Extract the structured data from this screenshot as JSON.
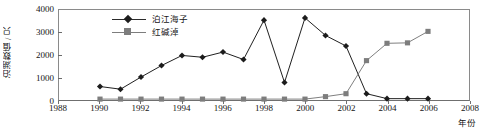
{
  "chart_data": {
    "type": "line",
    "title": "",
    "xlabel": "年份",
    "ylabel": "泊湖数值 / 只",
    "xlim": [
      1988,
      2008
    ],
    "ylim": [
      0,
      4000
    ],
    "ytick_labels": [
      "0",
      "1000",
      "2000",
      "3000",
      "4000"
    ],
    "ytick_values": [
      0,
      1000,
      2000,
      3000,
      4000
    ],
    "xtick_labels": [
      "1988",
      "1990",
      "1992",
      "1994",
      "1996",
      "1998",
      "2000",
      "2002",
      "2004",
      "2006",
      "2008"
    ],
    "xtick_values": [
      1988,
      1990,
      1992,
      1994,
      1996,
      1998,
      2000,
      2002,
      2004,
      2006,
      2008
    ],
    "grid": false,
    "legend_position": "upper-left-inside",
    "x": [
      1990,
      1991,
      1992,
      1993,
      1994,
      1995,
      1996,
      1997,
      1998,
      1999,
      2000,
      2001,
      2002,
      2003,
      2004,
      2005,
      2006
    ],
    "series": [
      {
        "name": "泊江海子",
        "marker": "diamond",
        "color": "#1c1c1c",
        "values": [
          600,
          480,
          1020,
          1530,
          1980,
          1900,
          2130,
          1800,
          3550,
          780,
          3650,
          2870,
          2400,
          280,
          60,
          60,
          60
        ]
      },
      {
        "name": "红碱淖",
        "marker": "square",
        "color": "#7d7d7d",
        "values": [
          40,
          40,
          40,
          40,
          40,
          40,
          40,
          40,
          40,
          40,
          40,
          150,
          280,
          1750,
          2520,
          2540,
          3050
        ]
      }
    ]
  },
  "legend": {
    "items": [
      {
        "label": "泊江海子",
        "marker": "diamond-marker"
      },
      {
        "label": "红碱淖",
        "marker": "square-marker"
      }
    ]
  },
  "axes": {
    "y_axis_title": "泊湖数值 / 只",
    "x_axis_title": "年份"
  }
}
